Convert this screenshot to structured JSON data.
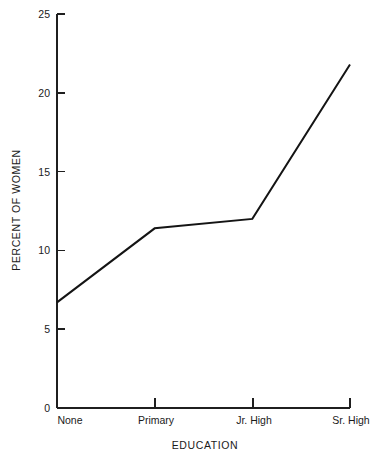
{
  "chart_data": {
    "type": "line",
    "title": "",
    "xlabel": "EDUCATION",
    "ylabel": "PERCENT OF WOMEN",
    "categories": [
      "None",
      "Primary",
      "Jr. High",
      "Sr. High"
    ],
    "values": [
      6.7,
      11.4,
      12.0,
      21.8
    ],
    "series": [
      {
        "name": "Percent of women",
        "values": [
          6.7,
          11.4,
          12.0,
          21.8
        ]
      }
    ],
    "ylim": [
      0,
      25
    ],
    "yticks": [
      0,
      5,
      10,
      15,
      20,
      25
    ],
    "ytick_labels": [
      "0",
      "5",
      "10",
      "15",
      "20",
      "25"
    ],
    "xtick_labels": [
      "None",
      "Primary",
      "Jr. High",
      "Sr. High"
    ],
    "grid": false,
    "legend": false,
    "legend_position": "none",
    "line_color": "#141414",
    "axis_color": "#1f1f1f",
    "background_color": "#ffffff",
    "tick_direction": "in"
  }
}
